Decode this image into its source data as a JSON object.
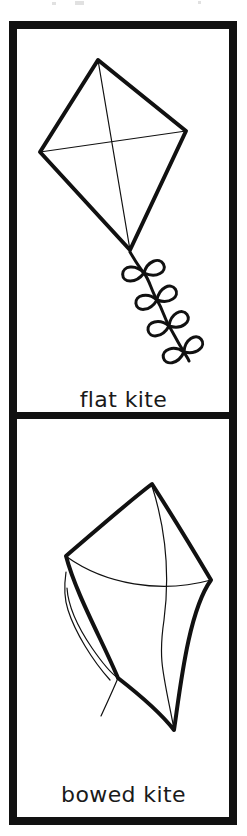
{
  "page": {
    "width": 247,
    "height": 836,
    "background_color": "#ffffff",
    "ink_color": "#111111",
    "border_color": "#111111"
  },
  "border": {
    "outer_thickness_px": 8,
    "divider_thickness_px": 7,
    "outer_rect": {
      "x": 9,
      "y": 21,
      "width": 228,
      "height": 804
    },
    "divider_y": 418
  },
  "panels": [
    {
      "id": "flat-kite",
      "label": "flat kite",
      "figure_name": "flat-kite-drawing",
      "description": "Diamond kite outline with two crossing thin spars and a tail of four bow knots",
      "bounds": {
        "x": 17,
        "y": 29,
        "width": 212,
        "height": 385
      },
      "kite": {
        "shape": "diamond",
        "vertices": {
          "top": {
            "x": 98,
            "y": 60
          },
          "left": {
            "x": 40,
            "y": 152
          },
          "right": {
            "x": 186,
            "y": 131
          },
          "bottom": {
            "x": 130,
            "y": 250
          }
        },
        "outline_stroke_width": 4,
        "spar_stroke_width": 1.2,
        "spars": [
          {
            "name": "vertical-spar",
            "from": "top",
            "to": "bottom"
          },
          {
            "name": "horizontal-spar",
            "from": "left",
            "to": "right"
          }
        ]
      },
      "tail": {
        "type": "bow-knots",
        "knot_count": 4,
        "stroke_width": 3,
        "start": {
          "x": 130,
          "y": 252
        },
        "end": {
          "x": 188,
          "y": 360
        },
        "knots": [
          {
            "x": 143,
            "y": 272,
            "angle": -14,
            "size": 15
          },
          {
            "x": 156,
            "y": 299,
            "angle": -20,
            "size": 15
          },
          {
            "x": 168,
            "y": 325,
            "angle": -22,
            "size": 15
          },
          {
            "x": 182,
            "y": 350,
            "angle": -26,
            "size": 15
          }
        ]
      }
    },
    {
      "id": "bowed-kite",
      "label": "bowed kite",
      "figure_name": "bowed-kite-drawing",
      "description": "Diamond kite drawn with curved bowed edges, a curved spar and a long thin trailing tail line",
      "bounds": {
        "x": 17,
        "y": 425,
        "width": 212,
        "height": 392
      },
      "kite": {
        "shape": "bowed-diamond",
        "vertices": {
          "top": {
            "x": 152,
            "y": 484
          },
          "left": {
            "x": 66,
            "y": 556
          },
          "right": {
            "x": 211,
            "y": 580
          },
          "bottom": {
            "x": 174,
            "y": 730
          }
        },
        "outline_stroke_width": 4,
        "spar_stroke_width": 1.2,
        "bow_curvature": "upper edges bow inward, lower edges nearly straight"
      },
      "tail": {
        "type": "thin-line",
        "stroke_width": 1.2,
        "start": {
          "x": 118,
          "y": 678
        },
        "end": {
          "x": 101,
          "y": 716
        }
      }
    }
  ],
  "artifacts": {
    "description": "faint grey scan specks above the top border",
    "specks": [
      {
        "x": 52,
        "y": 2,
        "width": 4,
        "height": 3
      },
      {
        "x": 75,
        "y": 1,
        "width": 9,
        "height": 4
      },
      {
        "x": 198,
        "y": 1,
        "width": 3,
        "height": 3
      }
    ]
  }
}
